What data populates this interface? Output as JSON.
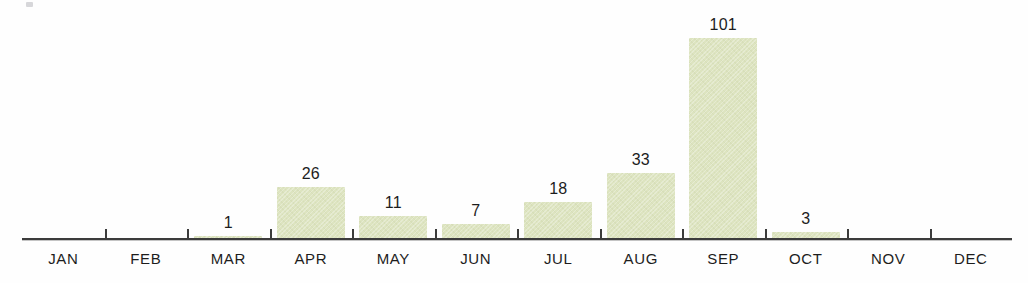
{
  "chart_data": {
    "type": "bar",
    "title": "",
    "subtitle": "",
    "xlabel": "",
    "ylabel": "",
    "categories": [
      "JAN",
      "FEB",
      "MAR",
      "APR",
      "MAY",
      "JUN",
      "JUL",
      "AUG",
      "SEP",
      "OCT",
      "NOV",
      "DEC"
    ],
    "values": [
      0,
      0,
      1,
      26,
      11,
      7,
      18,
      33,
      101,
      3,
      0,
      0
    ],
    "value_labels": [
      "",
      "",
      "1",
      "26",
      "11",
      "7",
      "18",
      "33",
      "101",
      "3",
      "",
      ""
    ],
    "ylim": [
      0,
      101
    ],
    "grid": false,
    "legend": null,
    "bar_color": "#dde4c0",
    "axis_color": "#3c3c3c",
    "label_color": "#1d1d1d",
    "background_color": "#fefefe",
    "annotations": []
  },
  "chart": {
    "bars": [
      {
        "month": "JAN",
        "value": 0,
        "label": ""
      },
      {
        "month": "FEB",
        "value": 0,
        "label": ""
      },
      {
        "month": "MAR",
        "value": 1,
        "label": "1"
      },
      {
        "month": "APR",
        "value": 26,
        "label": "26"
      },
      {
        "month": "MAY",
        "value": 11,
        "label": "11"
      },
      {
        "month": "JUN",
        "value": 7,
        "label": "7"
      },
      {
        "month": "JUL",
        "value": 18,
        "label": "18"
      },
      {
        "month": "AUG",
        "value": 33,
        "label": "33"
      },
      {
        "month": "SEP",
        "value": 101,
        "label": "101"
      },
      {
        "month": "OCT",
        "value": 3,
        "label": "3"
      },
      {
        "month": "NOV",
        "value": 0,
        "label": ""
      },
      {
        "month": "DEC",
        "value": 0,
        "label": ""
      }
    ]
  }
}
